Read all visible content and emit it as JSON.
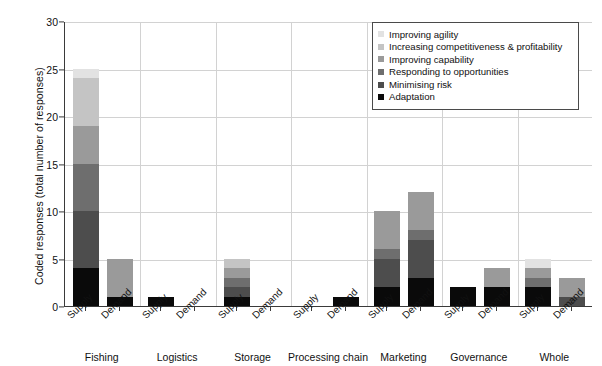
{
  "chart_data": {
    "type": "bar",
    "subtype": "stacked-grouped-bar",
    "title": "",
    "xlabel": "",
    "ylabel": "Coded responses (total number of responses)",
    "ylim": [
      0,
      30
    ],
    "yticks": [
      0,
      5,
      10,
      15,
      20,
      25,
      30
    ],
    "grid": true,
    "legend_position": "top-right",
    "groups": [
      "Fishing",
      "Logistics",
      "Storage",
      "Processing chain",
      "Marketing",
      "Governance",
      "Whole"
    ],
    "subcategories": [
      "Supply",
      "Demand"
    ],
    "categories": [
      "Fishing Supply",
      "Fishing Demand",
      "Logistics Supply",
      "Logistics Demand",
      "Storage Supply",
      "Storage Demand",
      "Processing chain Supply",
      "Processing chain Demand",
      "Marketing Supply",
      "Marketing Demand",
      "Governance Supply",
      "Governance Demand",
      "Whole Supply",
      "Whole Demand"
    ],
    "series": [
      {
        "name": "Adaptation",
        "color": "#0a0a0a",
        "values": [
          4,
          1,
          1,
          0,
          1,
          0,
          0,
          1,
          2,
          3,
          2,
          2,
          2,
          0
        ]
      },
      {
        "name": "Minimising risk",
        "color": "#4d4d4d",
        "values": [
          6,
          0,
          0,
          0,
          1,
          0,
          0,
          0,
          3,
          4,
          0,
          0,
          0,
          1
        ]
      },
      {
        "name": "Responding to opportunities",
        "color": "#6e6e6e",
        "values": [
          5,
          0,
          0,
          0,
          1,
          0,
          0,
          0,
          1,
          1,
          0,
          0,
          1,
          0
        ]
      },
      {
        "name": "Improving capability",
        "color": "#9a9a9a",
        "values": [
          4,
          4,
          0,
          0,
          1,
          0,
          0,
          0,
          4,
          4,
          0,
          2,
          1,
          2
        ]
      },
      {
        "name": "Increasing competitiveness & profitability",
        "color": "#c4c4c4",
        "values": [
          5,
          0,
          0,
          0,
          1,
          0,
          0,
          0,
          0,
          0,
          0,
          0,
          0,
          0
        ]
      },
      {
        "name": "Improving agility",
        "color": "#e2e2e2",
        "values": [
          1,
          0,
          0,
          0,
          0,
          0,
          0,
          0,
          0,
          0,
          0,
          0,
          1,
          0
        ]
      }
    ],
    "totals": [
      25,
      5,
      1,
      0,
      5,
      0,
      0,
      1,
      10,
      12,
      2,
      4,
      5,
      3
    ]
  },
  "legend": {
    "items": [
      {
        "label": "Improving agility",
        "color": "#e2e2e2"
      },
      {
        "label": "Increasing competitiveness & profitability",
        "color": "#c4c4c4"
      },
      {
        "label": "Improving capability",
        "color": "#9a9a9a"
      },
      {
        "label": "Responding to opportunities",
        "color": "#6e6e6e"
      },
      {
        "label": "Minimising risk",
        "color": "#4d4d4d"
      },
      {
        "label": "Adaptation",
        "color": "#0a0a0a"
      }
    ]
  },
  "axes": {
    "y_title": "Coded responses (total number of responses)",
    "y_tick_labels": [
      "0",
      "5",
      "10",
      "15",
      "20",
      "25",
      "30"
    ],
    "x_sub_labels": [
      "Supply",
      "Demand",
      "Supply",
      "Demand",
      "Supply",
      "Demand",
      "Supply",
      "Demand",
      "Supply",
      "Demand",
      "Supply",
      "Demand",
      "Supply",
      "Demand"
    ],
    "x_group_labels": [
      "Fishing",
      "Logistics",
      "Storage",
      "Processing chain",
      "Marketing",
      "Governance",
      "Whole"
    ]
  }
}
